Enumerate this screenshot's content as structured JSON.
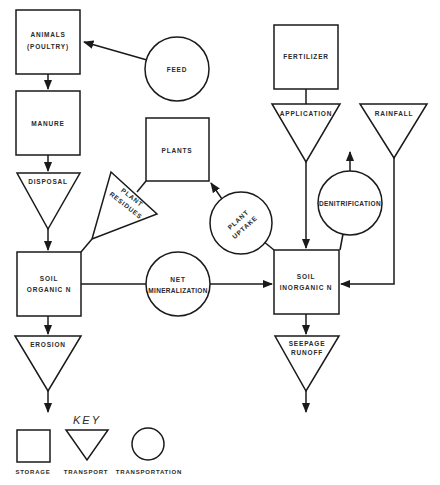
{
  "diagram": {
    "nodes": {
      "animals": {
        "type": "storage",
        "line1": "ANIMALS",
        "line2": "(POULTRY)"
      },
      "feed": {
        "type": "transformation",
        "label": "FEED"
      },
      "manure": {
        "type": "storage",
        "label": "MANURE"
      },
      "plants": {
        "type": "storage",
        "label": "PLANTS"
      },
      "fertilizer": {
        "type": "storage",
        "label": "FERTILIZER"
      },
      "application": {
        "type": "transport",
        "label": "APPLICATION"
      },
      "rainfall": {
        "type": "transport",
        "label": "RAINFALL"
      },
      "disposal": {
        "type": "transport",
        "label": "DISPOSAL"
      },
      "plant_residues": {
        "type": "transport",
        "line1": "PLANT",
        "line2": "RESIDUES"
      },
      "plant_uptake": {
        "type": "transformation",
        "line1": "PLANT",
        "line2": "UPTAKE"
      },
      "denitrification": {
        "type": "transformation",
        "label": "DENITRIFICATION"
      },
      "soil_organic_n": {
        "type": "storage",
        "line1": "SOIL",
        "line2": "ORGANIC N"
      },
      "net_mineralization": {
        "type": "transformation",
        "line1": "NET",
        "line2": "MINERALIZATION"
      },
      "soil_inorganic_n": {
        "type": "storage",
        "line1": "SOIL",
        "line2": "INORGANIC N"
      },
      "erosion": {
        "type": "transport",
        "label": "EROSION"
      },
      "seepage_runoff": {
        "type": "transport",
        "line1": "SEEPAGE",
        "line2": "RUNOFF"
      }
    },
    "edges": [
      {
        "from": "feed",
        "to": "animals"
      },
      {
        "from": "animals",
        "to": "manure"
      },
      {
        "from": "manure",
        "to": "disposal"
      },
      {
        "from": "disposal",
        "to": "soil_organic_n"
      },
      {
        "from": "plants",
        "to": "plant_residues"
      },
      {
        "from": "plant_residues",
        "to": "soil_organic_n"
      },
      {
        "from": "soil_inorganic_n",
        "to": "plant_uptake"
      },
      {
        "from": "plant_uptake",
        "to": "plants"
      },
      {
        "from": "soil_organic_n",
        "to": "net_mineralization"
      },
      {
        "from": "net_mineralization",
        "to": "soil_inorganic_n"
      },
      {
        "from": "fertilizer",
        "to": "application"
      },
      {
        "from": "application",
        "to": "soil_inorganic_n"
      },
      {
        "from": "rainfall",
        "to": "soil_inorganic_n"
      },
      {
        "from": "soil_inorganic_n",
        "to": "denitrification"
      },
      {
        "from": "denitrification",
        "to": "out"
      },
      {
        "from": "soil_organic_n",
        "to": "erosion"
      },
      {
        "from": "erosion",
        "to": "out"
      },
      {
        "from": "soil_inorganic_n",
        "to": "seepage_runoff"
      },
      {
        "from": "seepage_runoff",
        "to": "out"
      }
    ],
    "key": {
      "title": "KEY",
      "storage": "STORAGE",
      "transport": "TRANSPORT",
      "transformation": "TRANSPORTATION"
    }
  }
}
